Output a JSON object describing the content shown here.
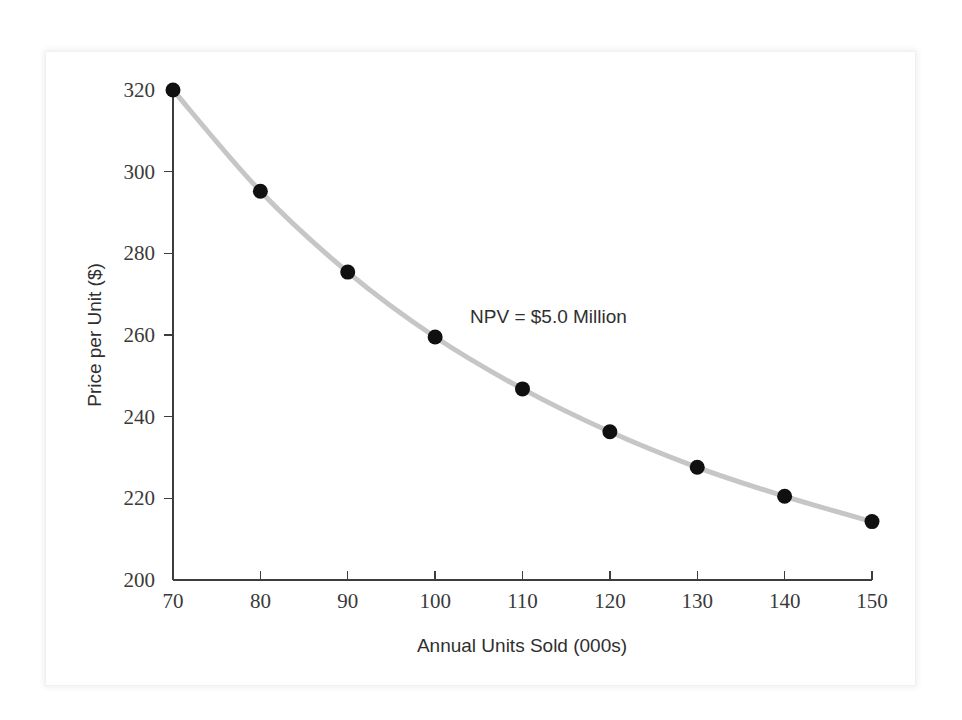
{
  "figure": {
    "background_color": "#ffffff",
    "frame_color": "#ededed"
  },
  "chart_data": {
    "type": "line",
    "title": "",
    "subtitle": "",
    "xlabel": "Annual Units Sold (000s)",
    "ylabel": "Price per Unit ($)",
    "xlim": [
      70,
      150
    ],
    "ylim": [
      200,
      320
    ],
    "xticks": [
      70,
      80,
      90,
      100,
      110,
      120,
      130,
      140,
      150
    ],
    "yticks": [
      200,
      220,
      240,
      260,
      280,
      300,
      320
    ],
    "xtick_labels": [
      "70",
      "80",
      "90",
      "100",
      "110",
      "120",
      "130",
      "140",
      "150"
    ],
    "ytick_labels": [
      "200",
      "220",
      "240",
      "260",
      "280",
      "300",
      "320"
    ],
    "grid": false,
    "legend": null,
    "legend_position": "none",
    "line_color": "#c6c6c6",
    "marker_color": "#101010",
    "x": [
      70,
      80,
      90,
      100,
      110,
      120,
      130,
      140,
      150
    ],
    "values": [
      320.0,
      295.2,
      275.4,
      259.5,
      246.8,
      236.3,
      227.6,
      220.5,
      214.3
    ],
    "series": [
      {
        "name": "NPV = $5.0 Million",
        "x": [
          70,
          80,
          90,
          100,
          110,
          120,
          130,
          140,
          150
        ],
        "values": [
          320.0,
          295.2,
          275.4,
          259.5,
          246.8,
          236.3,
          227.6,
          220.5,
          214.3
        ]
      }
    ],
    "annotations": [
      {
        "text": "NPV = $5.0 Million",
        "x": 104,
        "y": 263
      }
    ]
  }
}
